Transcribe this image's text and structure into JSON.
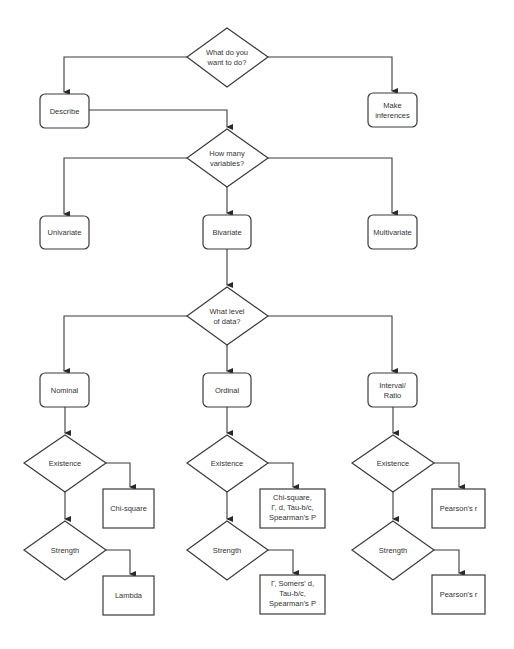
{
  "diagram": {
    "type": "flowchart",
    "title": "",
    "colors": {
      "stroke": "#3a3a3a",
      "text": "#333333",
      "background": "#ffffff"
    },
    "nodes": {
      "q_purpose": {
        "kind": "decision",
        "lines": [
          "What do you",
          "want to do?"
        ]
      },
      "describe": {
        "kind": "rounded",
        "lines": [
          "Describe"
        ]
      },
      "inferences": {
        "kind": "rounded",
        "lines": [
          "Make",
          "inferences"
        ]
      },
      "q_variables": {
        "kind": "decision",
        "lines": [
          "How many",
          "variables?"
        ]
      },
      "univariate": {
        "kind": "rounded",
        "lines": [
          "Univariate"
        ]
      },
      "bivariate": {
        "kind": "rounded",
        "lines": [
          "Bivariate"
        ]
      },
      "multivariate": {
        "kind": "rounded",
        "lines": [
          "Multivariate"
        ]
      },
      "q_level": {
        "kind": "decision",
        "lines": [
          "What level",
          "of data?"
        ]
      },
      "nominal": {
        "kind": "rounded",
        "lines": [
          "Nominal"
        ]
      },
      "ordinal": {
        "kind": "rounded",
        "lines": [
          "Ordinal"
        ]
      },
      "interval": {
        "kind": "rounded",
        "lines": [
          "Interval/",
          "Ratio"
        ]
      },
      "nom_existence": {
        "kind": "decision",
        "lines": [
          "Existence"
        ]
      },
      "nom_existence_result": {
        "kind": "box",
        "lines": [
          "Chi-square"
        ]
      },
      "nom_strength": {
        "kind": "decision",
        "lines": [
          "Strength"
        ]
      },
      "nom_strength_result": {
        "kind": "box",
        "lines": [
          "Lambda"
        ]
      },
      "ord_existence": {
        "kind": "decision",
        "lines": [
          "Existence"
        ]
      },
      "ord_existence_result": {
        "kind": "box",
        "lines": [
          "Chi-square,",
          "Γ, d, Tau-b/c,",
          "Spearman's P"
        ]
      },
      "ord_strength": {
        "kind": "decision",
        "lines": [
          "Strength"
        ]
      },
      "ord_strength_result": {
        "kind": "box",
        "lines": [
          "Γ, Somers' d,",
          "Tau-b/c,",
          "Spearman's P"
        ]
      },
      "int_existence": {
        "kind": "decision",
        "lines": [
          "Existence"
        ]
      },
      "int_existence_result": {
        "kind": "box",
        "lines": [
          "Pearson's r"
        ]
      },
      "int_strength": {
        "kind": "decision",
        "lines": [
          "Strength"
        ]
      },
      "int_strength_result": {
        "kind": "box",
        "lines": [
          "Pearson's r"
        ]
      }
    },
    "edges": [
      [
        "q_purpose",
        "describe"
      ],
      [
        "q_purpose",
        "inferences"
      ],
      [
        "describe",
        "q_variables"
      ],
      [
        "q_variables",
        "univariate"
      ],
      [
        "q_variables",
        "bivariate"
      ],
      [
        "q_variables",
        "multivariate"
      ],
      [
        "bivariate",
        "q_level"
      ],
      [
        "q_level",
        "nominal"
      ],
      [
        "q_level",
        "ordinal"
      ],
      [
        "q_level",
        "interval"
      ],
      [
        "nominal",
        "nom_existence"
      ],
      [
        "nom_existence",
        "nom_existence_result"
      ],
      [
        "nom_existence",
        "nom_strength"
      ],
      [
        "nom_strength",
        "nom_strength_result"
      ],
      [
        "ordinal",
        "ord_existence"
      ],
      [
        "ord_existence",
        "ord_existence_result"
      ],
      [
        "ord_existence",
        "ord_strength"
      ],
      [
        "ord_strength",
        "ord_strength_result"
      ],
      [
        "interval",
        "int_existence"
      ],
      [
        "int_existence",
        "int_existence_result"
      ],
      [
        "int_existence",
        "int_strength"
      ],
      [
        "int_strength",
        "int_strength_result"
      ]
    ]
  }
}
